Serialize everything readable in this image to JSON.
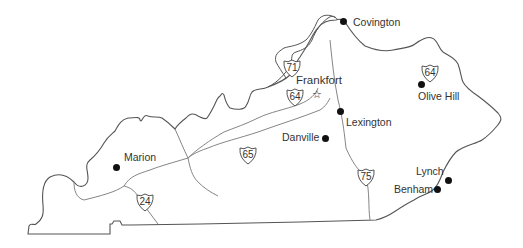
{
  "map": {
    "title": "Kentucky",
    "colors": {
      "border": "#555555",
      "road": "#777777",
      "city": "#111111",
      "text": "#333333"
    },
    "cities": [
      {
        "name": "Covington",
        "type": "city",
        "x": 343,
        "y": 22
      },
      {
        "name": "Frankfort",
        "type": "capital",
        "x": 316,
        "y": 94
      },
      {
        "name": "Lexington",
        "type": "city",
        "x": 340,
        "y": 111
      },
      {
        "name": "Olive Hill",
        "type": "city",
        "x": 421,
        "y": 84
      },
      {
        "name": "Danville",
        "type": "city",
        "x": 325,
        "y": 138
      },
      {
        "name": "Marion",
        "type": "city",
        "x": 116,
        "y": 167
      },
      {
        "name": "Lynch",
        "type": "city",
        "x": 448,
        "y": 180
      },
      {
        "name": "Benham",
        "type": "city",
        "x": 437,
        "y": 189
      }
    ],
    "interstates": [
      {
        "number": "71",
        "x": 282,
        "y": 60
      },
      {
        "number": "64",
        "x": 286,
        "y": 88
      },
      {
        "number": "64",
        "x": 429,
        "y": 65
      },
      {
        "number": "65",
        "x": 238,
        "y": 147
      },
      {
        "number": "75",
        "x": 358,
        "y": 167
      },
      {
        "number": "24",
        "x": 135,
        "y": 197
      }
    ]
  }
}
